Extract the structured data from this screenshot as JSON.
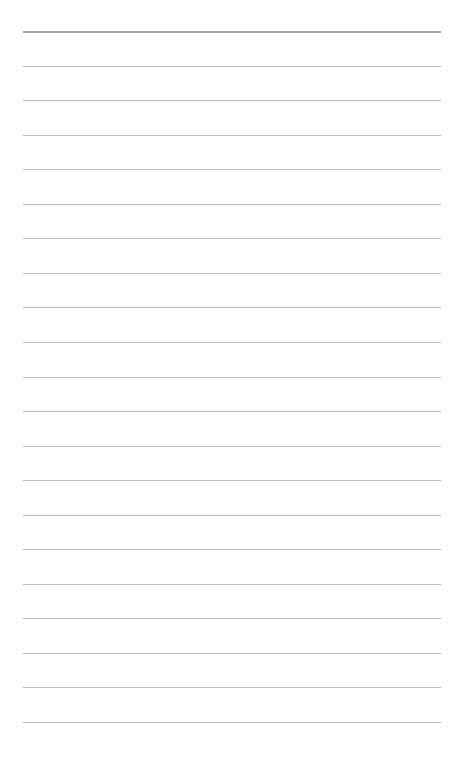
{
  "page": {
    "type": "lined-paper",
    "background_color": "#ffffff",
    "line_color": "#bdbdbd",
    "line_count": 21,
    "first_line_y": 31,
    "line_spacing": 34.55,
    "line_left": 23,
    "line_width": 418,
    "lines": []
  }
}
